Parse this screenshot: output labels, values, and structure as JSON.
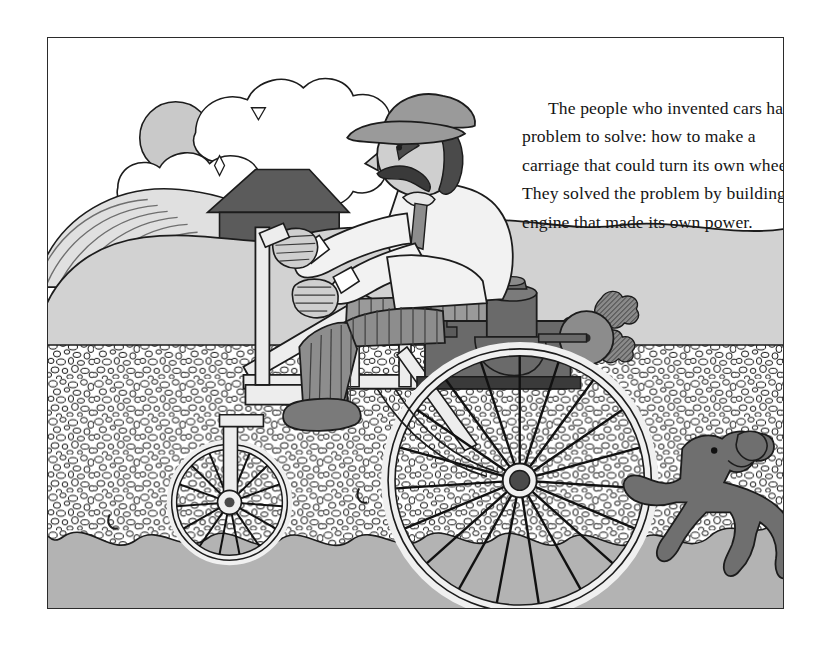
{
  "page": {
    "background_color": "#ffffff",
    "width": 813,
    "height": 648
  },
  "illustration": {
    "frame": {
      "border_color": "#2b2b2b",
      "x": 47,
      "y": 37,
      "width": 737,
      "height": 572
    },
    "caption": {
      "text": "The people who invented cars had a problem to solve: how to make a carriage that could turn its own wheels. They solved the problem by building an engine that made its own power.",
      "color": "#151515",
      "font_style": "serif"
    },
    "scene_name": "early-automobile-on-gravel-road",
    "sky": {
      "color": "#ffffff",
      "label": "sky"
    },
    "sun": {
      "color": "#c9c9c9",
      "label": "sun",
      "cx": 128,
      "cy": 100,
      "r": 36
    },
    "cloud": {
      "color": "#ffffff",
      "shadow_color": "#c5c5c5",
      "label": "cloud"
    },
    "hill_striped": {
      "color": "#e0e0e0",
      "stripe_color": "#6f6f6f",
      "label": "striped-field-hill"
    },
    "barn": {
      "roof_color": "#5b5b5b",
      "body_color": "#5b5b5b",
      "label": "barn"
    },
    "hill_front": {
      "color": "#d2d2d2",
      "label": "foreground-hill"
    },
    "gravel": {
      "color": "#ffffff",
      "pebble_outline": "#111111",
      "label": "gravel-road",
      "top": 308,
      "bottom": 512
    },
    "ground_band": {
      "color": "#b3b3b3",
      "label": "lower-ground-band"
    },
    "driver": {
      "label": "driver",
      "cap_color": "#9a9a9a",
      "hair_color": "#4a4a4a",
      "skin_color": "#cfcfcf",
      "shirt_color": "#f2f2f2",
      "trousers_color": "#8d8d8d",
      "shoe_color": "#7a7a7a"
    },
    "vehicle": {
      "label": "horseless-carriage",
      "frame_color": "#ededed",
      "seat_color": "#9a9a9a",
      "engine_color": "#6a6a6a",
      "flywheel_color": "#8c8c8c",
      "wheel_rim_color": "#f0f0f0",
      "spoke_color": "#111111",
      "rear_wheel": {
        "cx": 473,
        "cy": 444,
        "r": 132
      },
      "front_wheel": {
        "cx": 182,
        "cy": 466,
        "r": 58
      }
    },
    "exhaust_puffs": {
      "color": "#777777",
      "count": 3,
      "label": "exhaust-smoke-puffs"
    },
    "dog": {
      "color": "#6f6f6f",
      "label": "running-dog"
    }
  },
  "labels": {
    "frame_name": "illustration-frame",
    "caption_name": "caption-paragraph"
  }
}
